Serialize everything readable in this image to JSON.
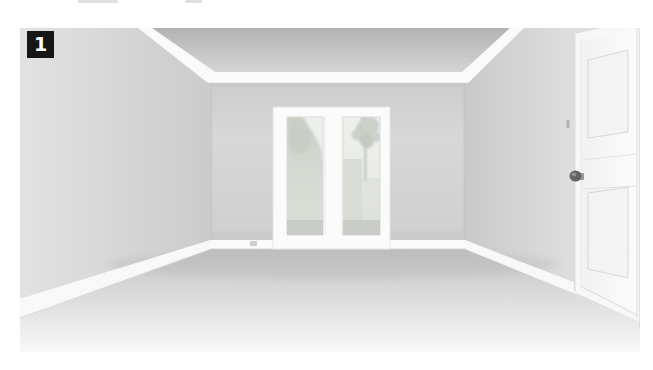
{
  "photo": {
    "badge": {
      "label": "1",
      "background": "#161616",
      "color": "#ffffff"
    },
    "palette": {
      "wall": "#d6d6d6",
      "ceiling": "#bcbcbc",
      "floor": "#dedede",
      "trim": "#fafafa",
      "glass": "#eaede8",
      "foliage": "#c9cfc6",
      "doorknob": "#616161"
    }
  }
}
